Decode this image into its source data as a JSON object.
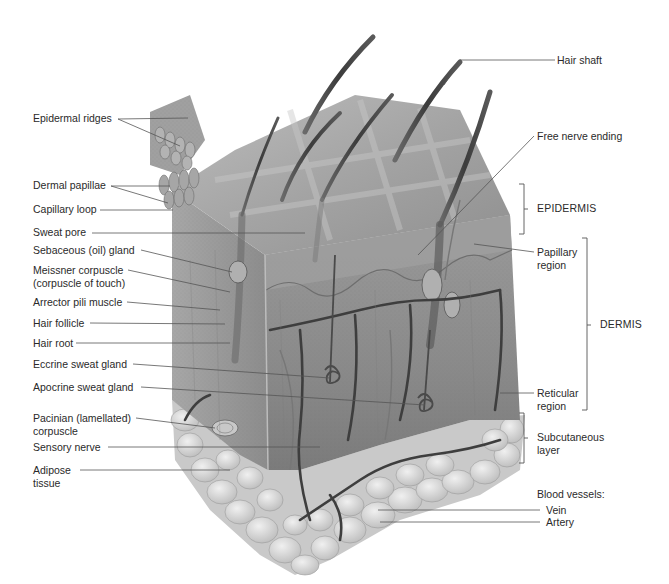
{
  "figure": {
    "colors": {
      "background": "#ffffff",
      "text": "#2a2a2a",
      "leader_line": "#555555",
      "epidermis_surface": "#a8a8a8",
      "dermis": "#8e8e8e",
      "adipose": "#d2d2d2",
      "vessel": "#3e3e3e",
      "hair": "#4a4a4a"
    }
  },
  "labels_left": [
    {
      "id": "epidermal-ridges",
      "text": "Epidermal ridges"
    },
    {
      "id": "dermal-papillae",
      "text": "Dermal papillae"
    },
    {
      "id": "capillary-loop",
      "text": "Capillary loop"
    },
    {
      "id": "sweat-pore",
      "text": "Sweat pore"
    },
    {
      "id": "sebaceous-gland",
      "text": "Sebaceous (oil) gland"
    },
    {
      "id": "meissner-corpuscle",
      "text": "Meissner corpuscle",
      "text2": "(corpuscle of touch)"
    },
    {
      "id": "arrector-pili",
      "text": "Arrector pili muscle"
    },
    {
      "id": "hair-follicle",
      "text": "Hair follicle"
    },
    {
      "id": "hair-root",
      "text": "Hair root"
    },
    {
      "id": "eccrine-gland",
      "text": "Eccrine sweat gland"
    },
    {
      "id": "apocrine-gland",
      "text": "Apocrine sweat gland"
    },
    {
      "id": "pacinian-corpuscle",
      "text": "Pacinian (lamellated)",
      "text2": "corpuscle"
    },
    {
      "id": "sensory-nerve",
      "text": "Sensory nerve"
    },
    {
      "id": "adipose-tissue",
      "text": "Adipose",
      "text2": "tissue"
    }
  ],
  "labels_right": [
    {
      "id": "hair-shaft",
      "text": "Hair shaft"
    },
    {
      "id": "free-nerve-ending",
      "text": "Free nerve ending"
    },
    {
      "id": "papillary-region",
      "text": "Papillary",
      "text2": "region"
    },
    {
      "id": "reticular-region",
      "text": "Reticular",
      "text2": "region"
    },
    {
      "id": "blood-vessels-heading",
      "text": "Blood vessels:"
    },
    {
      "id": "vein",
      "text": "Vein"
    },
    {
      "id": "artery",
      "text": "Artery"
    }
  ],
  "brackets": [
    {
      "id": "epidermis",
      "text": "EPIDERMIS"
    },
    {
      "id": "dermis",
      "text": "DERMIS"
    },
    {
      "id": "subcutaneous",
      "text": "Subcutaneous",
      "text2": "layer"
    }
  ]
}
